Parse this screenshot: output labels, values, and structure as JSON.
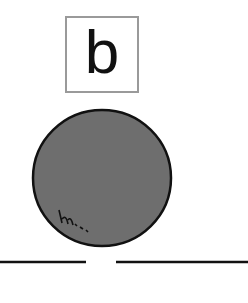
{
  "diagram": {
    "label": "b",
    "ball": {
      "fill": "#6e6e6e",
      "stroke": "#111111"
    },
    "ground": {
      "color": "#111111",
      "gap": true
    }
  }
}
